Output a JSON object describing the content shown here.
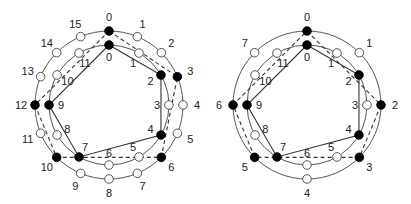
{
  "colors": {
    "ring": "#555555",
    "edge": "#333333",
    "filled": "#000000",
    "open": "#ffffff",
    "text": "#222222"
  },
  "diagrams": [
    {
      "name": "left-diagram",
      "center": [
        109,
        105
      ],
      "outer": {
        "count": 16,
        "radius": 74,
        "label_radius": 88,
        "labels": [
          "0",
          "1",
          "2",
          "3",
          "4",
          "5",
          "6",
          "7",
          "8",
          "9",
          "10",
          "11",
          "12",
          "13",
          "14",
          "15"
        ],
        "filled": [
          0,
          3,
          6,
          10,
          12
        ],
        "path_dashed": [
          0,
          3,
          6,
          10,
          12,
          0
        ]
      },
      "inner": {
        "count": 12,
        "radius": 60,
        "label_radius": 48,
        "labels": [
          "0",
          "1",
          "2",
          "3",
          "4",
          "5",
          "6",
          "7",
          "8",
          "9",
          "10",
          "11"
        ],
        "filled": [
          0,
          2,
          4,
          7,
          9
        ],
        "path_solid": [
          0,
          2,
          4,
          7,
          9,
          0
        ]
      }
    },
    {
      "name": "right-diagram",
      "center": [
        307,
        105
      ],
      "outer": {
        "count": 8,
        "radius": 74,
        "label_radius": 88,
        "labels": [
          "0",
          "1",
          "2",
          "3",
          "4",
          "5",
          "6",
          "7"
        ],
        "filled": [
          0,
          2,
          3,
          5,
          6
        ],
        "path_dashed": [
          0,
          2,
          3,
          5,
          6,
          0
        ]
      },
      "inner": {
        "count": 12,
        "radius": 60,
        "label_radius": 48,
        "labels": [
          "0",
          "1",
          "2",
          "3",
          "4",
          "5",
          "6",
          "7",
          "8",
          "9",
          "10",
          "11"
        ],
        "filled": [
          0,
          2,
          4,
          7,
          9
        ],
        "path_solid": [
          0,
          2,
          4,
          7,
          9,
          0
        ]
      }
    }
  ]
}
